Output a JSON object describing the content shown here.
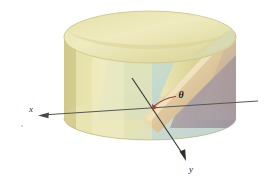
{
  "figure": {
    "kind": "3d-geometry-illustration",
    "background_color": "#ffffff"
  },
  "labels": {
    "x_axis": "x",
    "y_axis": "y",
    "angle": "θ",
    "z_tick": "z"
  },
  "colors": {
    "cylinder_body_light": "#ece8b4",
    "cylinder_body_mid": "#e2dd9f",
    "cylinder_body_shadow": "#cfc887",
    "cylinder_top_light": "#eeeab8",
    "cylinder_top_shadow": "#d8d293",
    "plane_green": "#cfe0c0",
    "plane_teal": "#bdd6cf",
    "plane_tan": "#d8c39d",
    "plane_mauve": "#a9959f",
    "plane_purple": "#9b8a97",
    "plane_highlight": "#f1e6c8",
    "axis_line": "#4a4a42",
    "axis_line_light": "#7b7b72",
    "angle_arc": "#a4402a",
    "label_text": "#2b2b2b"
  },
  "geometry": {
    "cylinder": {
      "left_x": 64,
      "right_x": 236,
      "top_y": 11,
      "bottom_y": 140,
      "top_ellipse_ry": 26,
      "bottom_ellipse_ry": 22,
      "top_center_y": 37,
      "bottom_center_y": 118
    },
    "x_axis": {
      "from": [
        258,
        101
      ],
      "to": [
        38,
        116
      ],
      "arrow": "left"
    },
    "y_axis": {
      "from": [
        132,
        78
      ],
      "to": [
        186,
        160
      ],
      "arrow": "down-right"
    },
    "cut_plane": {
      "upper_right": [
        231,
        29
      ],
      "lower_left": [
        149,
        120
      ]
    },
    "angle_arc": {
      "center": [
        152,
        118
      ],
      "label_pos": [
        178,
        94
      ]
    }
  }
}
